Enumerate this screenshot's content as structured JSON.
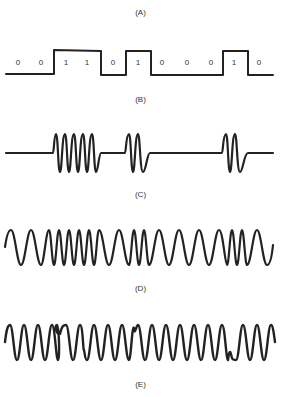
{
  "figure": {
    "panels": [
      {
        "id": "A",
        "label": "(A)",
        "description": "Binary data sequence"
      },
      {
        "id": "B",
        "label": "(B)",
        "description": "Digital square-wave signal"
      },
      {
        "id": "C",
        "label": "(C)",
        "description": "Amplitude-shift keying (carrier bursts for 1s)"
      },
      {
        "id": "D",
        "label": "(D)",
        "description": "Frequency-shift keying"
      },
      {
        "id": "E",
        "label": "(E)",
        "description": "Phase-shift keying"
      }
    ],
    "bits": [
      "0",
      "0",
      "1",
      "1",
      "0",
      "1",
      "0",
      "0",
      "0",
      "1",
      "0"
    ],
    "colors": {
      "line": "#222222",
      "text": "#333333",
      "background": "#ffffff"
    }
  }
}
